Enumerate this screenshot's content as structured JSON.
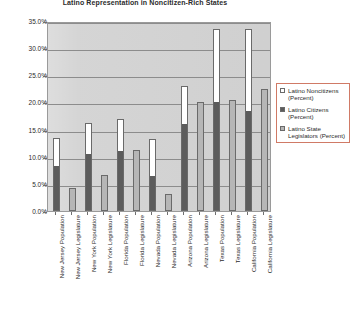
{
  "chart_data": {
    "type": "bar",
    "title": "Latino Representation in Noncitizen-Rich States",
    "xlabel": "",
    "ylabel": "",
    "ylim": [
      0,
      35
    ],
    "ytick_labels": [
      "0.0%",
      "5.0%",
      "10.0%",
      "15.0%",
      "20.0%",
      "25.0%",
      "30.0%",
      "35.0%"
    ],
    "ytick_values": [
      0,
      5,
      10,
      15,
      20,
      25,
      30,
      35
    ],
    "grid": true,
    "legend_position": "right",
    "stacked": true,
    "categories": [
      "New Jersey Population",
      "New Jersey Legislature",
      "New York Population",
      "New York Legislature",
      "Florida Population",
      "Florida Legislature",
      "Nevada Population",
      "Nevada Legislature",
      "Arizona Population",
      "Arizona Legislature",
      "Texas Population",
      "Texas Legislature",
      "California Population",
      "California Legislature"
    ],
    "series": [
      {
        "name": "Latino Citizens (Percent)",
        "key": "citizens",
        "color": "#5c5c5c",
        "values": [
          8.4,
          null,
          10.5,
          null,
          11.1,
          null,
          6.4,
          null,
          16.1,
          null,
          20.1,
          null,
          18.4,
          null
        ]
      },
      {
        "name": "Latino Noncitizens (Percent)",
        "key": "noncitizens",
        "color": "#ffffff",
        "values": [
          5.0,
          null,
          5.7,
          null,
          5.8,
          null,
          6.9,
          null,
          7.0,
          null,
          13.4,
          null,
          15.1,
          null
        ]
      },
      {
        "name": "Latino State Legislators (Percent)",
        "key": "legislators",
        "color": "#b6b6b6",
        "values": [
          null,
          4.2,
          null,
          6.6,
          null,
          11.2,
          null,
          3.2,
          null,
          20.0,
          null,
          20.5,
          null,
          22.5
        ]
      }
    ],
    "bars": [
      {
        "category": "New Jersey Population",
        "citizens": 8.4,
        "noncitizens": 5.0,
        "total": 13.4
      },
      {
        "category": "New Jersey Legislature",
        "legislators": 4.2,
        "total": 4.2
      },
      {
        "category": "New York Population",
        "citizens": 10.5,
        "noncitizens": 5.7,
        "total": 16.2
      },
      {
        "category": "New York Legislature",
        "legislators": 6.6,
        "total": 6.6
      },
      {
        "category": "Florida Population",
        "citizens": 11.1,
        "noncitizens": 5.8,
        "total": 16.9
      },
      {
        "category": "Florida Legislature",
        "legislators": 11.2,
        "total": 11.2
      },
      {
        "category": "Nevada Population",
        "citizens": 6.4,
        "noncitizens": 6.9,
        "total": 13.3
      },
      {
        "category": "Nevada Legislature",
        "legislators": 3.2,
        "total": 3.2
      },
      {
        "category": "Arizona Population",
        "citizens": 16.1,
        "noncitizens": 7.0,
        "total": 23.1
      },
      {
        "category": "Arizona Legislature",
        "legislators": 20.0,
        "total": 20.0
      },
      {
        "category": "Texas Population",
        "citizens": 20.1,
        "noncitizens": 13.4,
        "total": 33.5
      },
      {
        "category": "Texas Legislature",
        "legislators": 20.5,
        "total": 20.5
      },
      {
        "category": "California Population",
        "citizens": 18.4,
        "noncitizens": 15.1,
        "total": 33.5
      },
      {
        "category": "California Legislature",
        "legislators": 22.5,
        "total": 22.5
      }
    ]
  },
  "legend": {
    "items": [
      {
        "label": "Latino Noncitizens (Percent)",
        "swatch": "#ffffff"
      },
      {
        "label": "Latino Citizens (Percent)",
        "swatch": "#5c5c5c"
      },
      {
        "label": "Latino State Legislators (Percent)",
        "swatch": "#b6b6b6"
      }
    ]
  },
  "colors": {
    "plot_background": "#d4d4d4",
    "gridline": "#8c8c8c",
    "noncitizens": "#ffffff",
    "citizens": "#5c5c5c",
    "legislators": "#b6b6b6",
    "legend_border": "#d07a66",
    "text": "#2b2b2b"
  }
}
